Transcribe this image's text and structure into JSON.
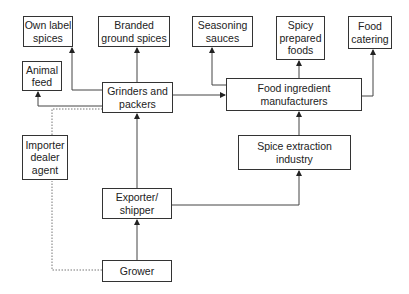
{
  "diagram": {
    "nodes": [
      {
        "id": "own_label",
        "label": "Own label\nspices",
        "x": 23,
        "y": 16,
        "w": 50,
        "h": 31
      },
      {
        "id": "branded",
        "label": "Branded\nground spices",
        "x": 98,
        "y": 16,
        "w": 72,
        "h": 31
      },
      {
        "id": "seasoning",
        "label": "Seasoning\nsauces",
        "x": 192,
        "y": 16,
        "w": 61,
        "h": 31
      },
      {
        "id": "spicy",
        "label": "Spicy\nprepared\nfoods",
        "x": 276,
        "y": 16,
        "w": 49,
        "h": 44
      },
      {
        "id": "catering",
        "label": "Food\ncatering",
        "x": 348,
        "y": 16,
        "w": 44,
        "h": 33
      },
      {
        "id": "animal_feed",
        "label": "Animal\nfeed",
        "x": 22,
        "y": 61,
        "w": 40,
        "h": 30
      },
      {
        "id": "grinders",
        "label": "Grinders and\npackers",
        "x": 102,
        "y": 82,
        "w": 71,
        "h": 31
      },
      {
        "id": "food_ingredient",
        "label": "Food ingredient\nmanufacturers",
        "x": 226,
        "y": 78,
        "w": 136,
        "h": 33
      },
      {
        "id": "importer",
        "label": "Importer\ndealer\nagent",
        "x": 22,
        "y": 135,
        "w": 46,
        "h": 45
      },
      {
        "id": "extraction",
        "label": "Spice extraction\nindustry",
        "x": 238,
        "y": 135,
        "w": 113,
        "h": 35
      },
      {
        "id": "exporter",
        "label": "Exporter/\nshipper",
        "x": 102,
        "y": 188,
        "w": 70,
        "h": 31
      },
      {
        "id": "grower",
        "label": "Grower",
        "x": 102,
        "y": 260,
        "w": 70,
        "h": 22
      }
    ],
    "edges": [
      {
        "from": "grower",
        "to": "exporter",
        "style": "solid"
      },
      {
        "from": "exporter",
        "to": "grinders",
        "style": "solid"
      },
      {
        "from": "exporter",
        "to": "extraction",
        "style": "solid"
      },
      {
        "from": "extraction",
        "to": "food_ingredient",
        "style": "solid"
      },
      {
        "from": "grinders",
        "to": "own_label",
        "style": "solid"
      },
      {
        "from": "grinders",
        "to": "branded",
        "style": "solid"
      },
      {
        "from": "grinders",
        "to": "animal_feed",
        "style": "solid"
      },
      {
        "from": "grinders",
        "to": "food_ingredient",
        "style": "solid"
      },
      {
        "from": "food_ingredient",
        "to": "seasoning",
        "style": "solid"
      },
      {
        "from": "food_ingredient",
        "to": "spicy",
        "style": "solid"
      },
      {
        "from": "food_ingredient",
        "to": "catering",
        "style": "solid"
      },
      {
        "from": "grower",
        "to": "grinders",
        "via": "importer",
        "style": "dotted"
      }
    ]
  }
}
